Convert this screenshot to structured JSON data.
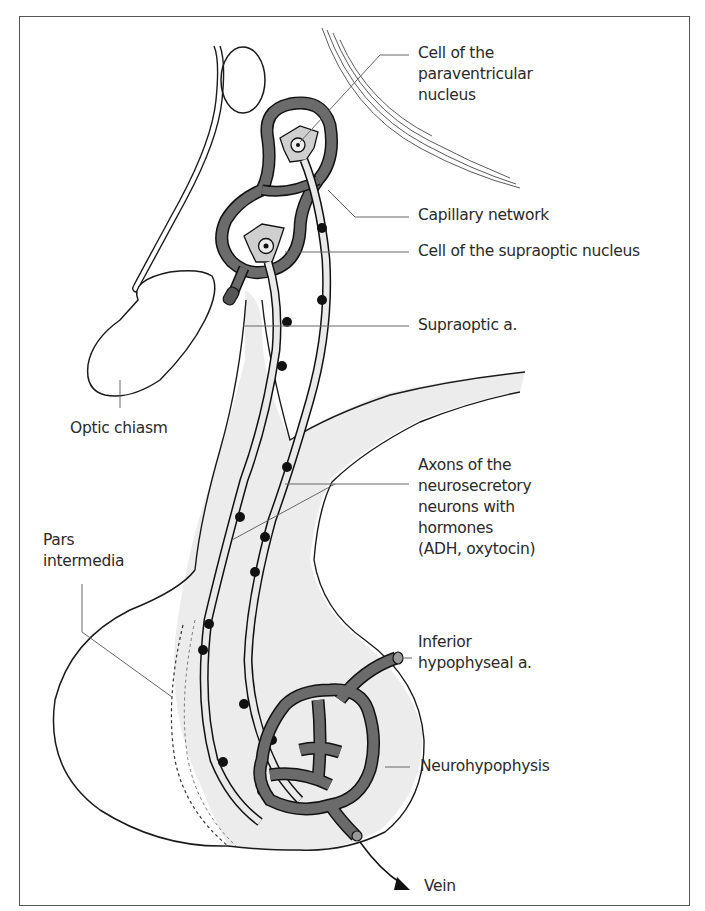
{
  "figure": {
    "colors": {
      "outline": "#1a1a1a",
      "capillary_fill": "#6b6b6b",
      "tissue_fill": "#ebebeb",
      "leader_line": "#666666",
      "granule": "#111111"
    }
  },
  "labels": {
    "paraventricular": "Cell of the\nparaventricular\nnucleus",
    "capillary_network": "Capillary network",
    "supraoptic_cell": "Cell of the supraoptic nucleus",
    "supraoptic_artery": "Supraoptic a.",
    "optic_chiasm": "Optic chiasm",
    "axons": "Axons of the\nneurosecretory\nneurons with\nhormones\n(ADH, oxytocin)",
    "pars_intermedia": "Pars\nintermedia",
    "inferior_hypophyseal": "Inferior\nhypophyseal a.",
    "neurohypophysis": "Neurohypophysis",
    "vein": "Vein"
  }
}
